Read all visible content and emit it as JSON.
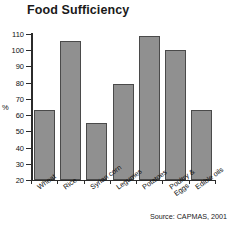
{
  "chart_data": {
    "type": "bar",
    "title": "Food Sufficiency",
    "xlabel": "",
    "ylabel": "%",
    "ylim": [
      20,
      110
    ],
    "yticks": [
      20,
      30,
      40,
      50,
      60,
      70,
      80,
      90,
      100,
      110
    ],
    "grid": false,
    "legend": null,
    "categories": [
      "Wheat",
      "Rice",
      "Syrian corn",
      "Legumes",
      "Potatoes",
      "Poultry &\nEggs",
      "Edible oils"
    ],
    "values": [
      63,
      106,
      55,
      79,
      109,
      100,
      63
    ],
    "source_note": "Source: CAPMAS, 2001",
    "bar_color": "#909090",
    "bar_border_color": "#4a4a4a",
    "axis_color": "#2b2b2b",
    "background": "#ffffff"
  }
}
